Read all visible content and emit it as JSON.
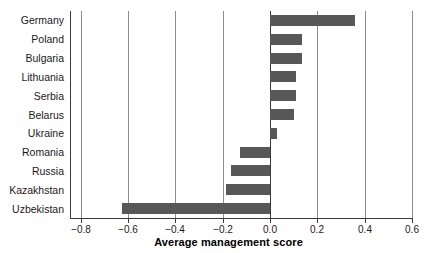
{
  "chart_data": {
    "type": "bar",
    "orientation": "horizontal",
    "title": "",
    "xlabel": "Average management score",
    "ylabel": "",
    "categories": [
      "Germany",
      "Poland",
      "Bulgaria",
      "Lithuania",
      "Serbia",
      "Belarus",
      "Ukraine",
      "Romania",
      "Russia",
      "Kazakhstan",
      "Uzbekistan"
    ],
    "values": [
      0.36,
      0.135,
      0.135,
      0.11,
      0.11,
      0.1,
      0.03,
      -0.125,
      -0.165,
      -0.185,
      -0.625
    ],
    "xlim": [
      -0.84,
      0.61
    ],
    "xticks": [
      -0.8,
      -0.6,
      -0.4,
      -0.2,
      0.0,
      0.2,
      0.4,
      0.6
    ],
    "xtick_labels": [
      "−0.8",
      "−0.6",
      "−0.4",
      "−0.2",
      "0.0",
      "0.2",
      "0.4",
      "0.6"
    ],
    "grid": "vertical",
    "legend": "none",
    "bar_color": "#585858",
    "axis_color": "#3a3a3a",
    "grid_color": "#8d8d8d",
    "background": "#ffffff"
  }
}
